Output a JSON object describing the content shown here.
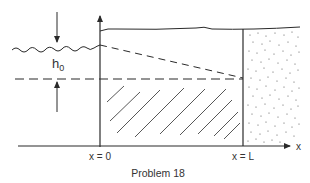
{
  "figure": {
    "caption": "Problem 18",
    "labels": {
      "head": "h",
      "head_sub": "0",
      "x_origin": "x = 0",
      "x_end": "x = L",
      "x_axis": "x"
    },
    "colors": {
      "ink": "#2a2a2a",
      "background": "#ffffff"
    },
    "elements": [
      "reservoir-water-surface",
      "vertical-axis",
      "horizontal-x-axis",
      "right-boundary-wall",
      "sloping-dashed-water-table",
      "horizontal-dashed-datum",
      "hatched-aquifer-region",
      "stippled-porous-region",
      "head-dimension-arrows"
    ]
  }
}
